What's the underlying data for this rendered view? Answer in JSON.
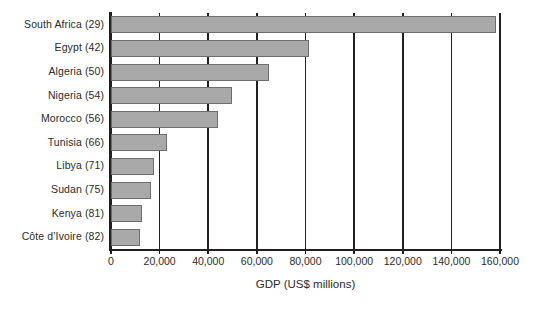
{
  "chart_data": {
    "type": "bar",
    "orientation": "horizontal",
    "title": "",
    "xlabel": "GDP (US$ millions)",
    "ylabel": "",
    "xlim": [
      0,
      160000
    ],
    "xticks": [
      0,
      20000,
      40000,
      60000,
      80000,
      100000,
      120000,
      140000,
      160000
    ],
    "xtick_labels": [
      "0",
      "20,000",
      "40,000",
      "60,000",
      "80,000",
      "100,000",
      "120,000",
      "140,000",
      "160,000"
    ],
    "grid": "vertical",
    "legend": "none",
    "categories": [
      "South Africa (29)",
      "Egypt (42)",
      "Algeria (50)",
      "Nigeria (54)",
      "Morocco (56)",
      "Tunisia (66)",
      "Libya (71)",
      "Sudan (75)",
      "Kenya (81)",
      "Côte d’Ivoire (82)"
    ],
    "values": [
      158500,
      81500,
      65000,
      49800,
      44000,
      23000,
      17700,
      16400,
      12700,
      11900
    ],
    "series": [
      {
        "name": "GDP (US$ millions)",
        "values": [
          158500,
          81500,
          65000,
          49800,
          44000,
          23000,
          17700,
          16400,
          12700,
          11900
        ]
      }
    ],
    "colors": {
      "bar_fill": "#a9a9a9",
      "bar_border": "#6e6e6e",
      "axis": "#231f20",
      "text": "#2b2b2b",
      "background": "#ffffff"
    }
  }
}
